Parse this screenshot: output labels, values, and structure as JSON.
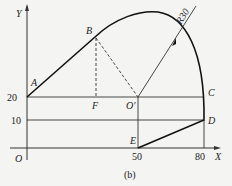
{
  "diagram": {
    "caption": "(b)",
    "axes": {
      "x_label": "X",
      "y_label": "Y",
      "origin_label": "O"
    },
    "ticks": {
      "x": [
        "50",
        "80"
      ],
      "y": [
        "20",
        "10"
      ]
    },
    "points": {
      "A": "A",
      "B": "B",
      "C": "C",
      "D": "D",
      "E": "E",
      "F": "F",
      "O_prime": "O'"
    },
    "radius_label": "R30",
    "colors": {
      "line": "#222222",
      "background": "#f4f4f2"
    }
  }
}
